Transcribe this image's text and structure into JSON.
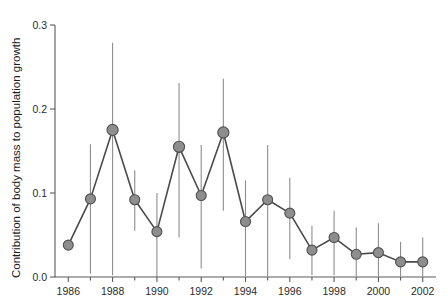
{
  "figure": {
    "background_color": "#ffffff",
    "marker_fill": "#8e8e8e",
    "marker_stroke": "#4f4f4f",
    "line_color": "#4a4a4a",
    "errorbar_color": "#8d8d8d",
    "axis_color": "#5b5b5b"
  },
  "chart_data": {
    "type": "line",
    "title": "",
    "subtitle": "",
    "xlabel": "",
    "ylabel": "Contribution of body mass to population growth",
    "xlim": [
      1985.4,
      2002.6
    ],
    "ylim": [
      0.0,
      0.3
    ],
    "grid": false,
    "legend": null,
    "x_tick_labels": [
      "1986",
      "1988",
      "1990",
      "1992",
      "1994",
      "1996",
      "1998",
      "2000",
      "2002"
    ],
    "x_tick_values": [
      1986,
      1988,
      1990,
      1992,
      1994,
      1996,
      1998,
      2000,
      2002
    ],
    "x_minor_ticks": [
      1987,
      1989,
      1991,
      1993,
      1995,
      1997,
      1999,
      2001
    ],
    "y_tick_labels": [
      "0.0",
      "0.1",
      "0.2",
      "0.3"
    ],
    "y_tick_values": [
      0.0,
      0.1,
      0.2,
      0.3
    ],
    "x": [
      1986,
      1987,
      1988,
      1989,
      1990,
      1991,
      1992,
      1993,
      1994,
      1995,
      1996,
      1997,
      1998,
      1999,
      2000,
      2001,
      2002
    ],
    "values": [
      0.038,
      0.093,
      0.175,
      0.092,
      0.054,
      0.155,
      0.097,
      0.172,
      0.066,
      0.092,
      0.076,
      0.032,
      0.047,
      0.027,
      0.029,
      0.018,
      0.018
    ],
    "error_low": [
      0.038,
      0.004,
      0.002,
      0.055,
      0.0,
      0.047,
      0.01,
      0.079,
      0.001,
      0.001,
      0.021,
      0.002,
      0.002,
      0.001,
      0.001,
      0.001,
      0.001
    ],
    "error_high": [
      0.038,
      0.158,
      0.279,
      0.127,
      0.1,
      0.231,
      0.157,
      0.236,
      0.115,
      0.157,
      0.118,
      0.061,
      0.079,
      0.059,
      0.064,
      0.042,
      0.047
    ],
    "series": [
      {
        "name": "Contribution of body mass to population growth",
        "values": [
          0.038,
          0.093,
          0.175,
          0.092,
          0.054,
          0.155,
          0.097,
          0.172,
          0.066,
          0.092,
          0.076,
          0.032,
          0.047,
          0.027,
          0.029,
          0.018,
          0.018
        ]
      }
    ]
  }
}
